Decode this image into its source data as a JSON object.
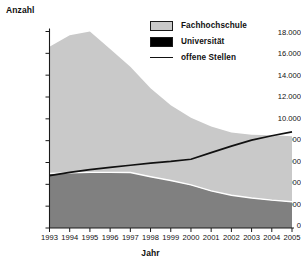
{
  "chart_data": {
    "type": "area",
    "title": "",
    "xlabel": "Jahr",
    "ylabel": "Anzahl",
    "grid": false,
    "legend_position": "top-right",
    "x": [
      1993,
      1994,
      1995,
      1996,
      1997,
      1998,
      1999,
      2000,
      2001,
      2002,
      2003,
      2004,
      2005
    ],
    "categories": [
      "1993",
      "1994",
      "1995",
      "1996",
      "1997",
      "1998",
      "1999",
      "2000",
      "2001",
      "2002",
      "2003",
      "2004",
      "2005"
    ],
    "xlim": [
      1993,
      2005
    ],
    "ylim": [
      0,
      18000
    ],
    "ytick_labels": [
      "18.000",
      "16.000",
      "14.000",
      "12.000",
      "10.000",
      "8.000",
      "6.000",
      "4.000",
      "2.000",
      "0"
    ],
    "ytick_values": [
      18000,
      16000,
      14000,
      12000,
      10000,
      8000,
      6000,
      4000,
      2000,
      0
    ],
    "stacked": true,
    "series": [
      {
        "name": "Universität",
        "kind": "area",
        "stack_order": 0,
        "color": "#808080",
        "legend_swatch_color": "#000000",
        "values": [
          5000,
          5050,
          5100,
          5100,
          5080,
          4700,
          4350,
          3950,
          3400,
          3000,
          2750,
          2550,
          2400
        ]
      },
      {
        "name": "Fachhochschule",
        "kind": "area",
        "stack_order": 1,
        "color": "#c9c9c9",
        "legend_swatch_color": "#c9c9c9",
        "values": [
          11600,
          12600,
          12900,
          11300,
          9700,
          8100,
          6900,
          6150,
          5900,
          5750,
          5800,
          5950,
          6000
        ]
      },
      {
        "name": "offene Stellen",
        "kind": "line",
        "color": "#111111",
        "values": [
          4800,
          5100,
          5350,
          5550,
          5750,
          5950,
          6100,
          6300,
          6900,
          7500,
          8050,
          8450,
          8800
        ]
      }
    ],
    "stack_totals": [
      16600,
      17650,
      18000,
      16400,
      14780,
      12800,
      11250,
      10100,
      9300,
      8750,
      8550,
      8500,
      8400
    ],
    "annotations": []
  },
  "legend": {
    "items": [
      {
        "label": "Fachhochschule",
        "swatch": "box-light"
      },
      {
        "label": "Universität",
        "swatch": "box-black"
      },
      {
        "label": "offene Stellen",
        "swatch": "line"
      }
    ]
  },
  "axes": {
    "y_title": "Anzahl",
    "x_title": "Jahr"
  },
  "colors": {
    "fachhochschule": "#c9c9c9",
    "universitaet_area": "#808080",
    "universitaet_legend": "#000000",
    "offene_stellen_line": "#111111",
    "axis": "#1a1a1a",
    "background": "#ffffff",
    "stack_divider": "#ffffff"
  }
}
